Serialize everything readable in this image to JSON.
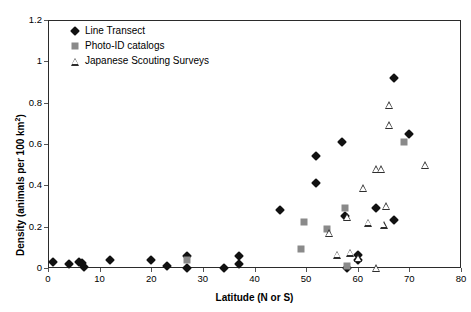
{
  "chart_data": {
    "type": "scatter",
    "title": "",
    "xlabel": "Latitude (N or S)",
    "ylabel": "Density (animals per 100 km²)",
    "ylabel_base": "Density (animals per 100 km",
    "ylabel_sup": "2",
    "ylabel_tail": ")",
    "xlim": [
      0,
      80
    ],
    "ylim": [
      0,
      1.2
    ],
    "xticks": [
      0,
      10,
      20,
      30,
      40,
      50,
      60,
      70,
      80
    ],
    "xtick_labels": [
      "0",
      "10",
      "20",
      "30",
      "40",
      "50",
      "60",
      "70",
      "80"
    ],
    "yticks": [
      0,
      0.2,
      0.4,
      0.6,
      0.8,
      1,
      1.2
    ],
    "ytick_labels": [
      "0",
      "0.2",
      "0.4",
      "0.6",
      "0.8",
      "1",
      "1.2"
    ],
    "grid": false,
    "legend_position": "top-left",
    "series": [
      {
        "name": "Line Transect",
        "marker": "diamond",
        "color": "#111111",
        "points": [
          [
            1,
            0.03
          ],
          [
            4,
            0.02
          ],
          [
            6,
            0.03
          ],
          [
            6.6,
            0.025
          ],
          [
            7,
            0.005
          ],
          [
            12,
            0.04
          ],
          [
            20,
            0.04
          ],
          [
            23,
            0.01
          ],
          [
            27,
            0.06
          ],
          [
            27,
            0.0
          ],
          [
            34,
            0.0
          ],
          [
            37,
            0.06
          ],
          [
            37,
            0.02
          ],
          [
            45,
            0.28
          ],
          [
            52,
            0.41
          ],
          [
            52,
            0.54
          ],
          [
            57,
            0.61
          ],
          [
            57.5,
            0.25
          ],
          [
            58,
            0.0
          ],
          [
            60,
            0.065
          ],
          [
            60,
            0.04
          ],
          [
            63.5,
            0.29
          ],
          [
            67,
            0.92
          ],
          [
            67,
            0.23
          ],
          [
            70,
            0.65
          ]
        ]
      },
      {
        "name": "Photo-ID catalogs",
        "marker": "square",
        "color": "#8a8a8a",
        "points": [
          [
            27,
            0.04
          ],
          [
            49,
            0.09
          ],
          [
            49.5,
            0.225
          ],
          [
            54,
            0.19
          ],
          [
            57.5,
            0.29
          ],
          [
            58,
            0.01
          ],
          [
            69,
            0.61
          ]
        ]
      },
      {
        "name": "Japanese Scouting Surveys",
        "marker": "triangle",
        "color": "#2e2e2e",
        "points": [
          [
            54.5,
            0.17
          ],
          [
            56,
            0.065
          ],
          [
            58,
            0.245
          ],
          [
            58.5,
            0.075
          ],
          [
            60,
            0.05
          ],
          [
            61,
            0.385
          ],
          [
            62,
            0.22
          ],
          [
            63.5,
            0.0
          ],
          [
            63.5,
            0.48
          ],
          [
            64.5,
            0.48
          ],
          [
            65,
            0.21
          ],
          [
            65.5,
            0.3
          ],
          [
            66,
            0.69
          ],
          [
            66,
            0.79
          ],
          [
            73,
            0.5
          ]
        ]
      }
    ]
  },
  "legend": {
    "items": [
      {
        "label": "Line Transect",
        "marker": "diamond"
      },
      {
        "label": "Photo-ID catalogs",
        "marker": "square"
      },
      {
        "label": "Japanese Scouting Surveys",
        "marker": "triangle"
      }
    ]
  },
  "colors": {
    "line_transect": "#111111",
    "photo_id": "#8a8a8a",
    "scouting": "#2e2e2e",
    "frame": "#2b2b2b",
    "background": "#ffffff"
  }
}
